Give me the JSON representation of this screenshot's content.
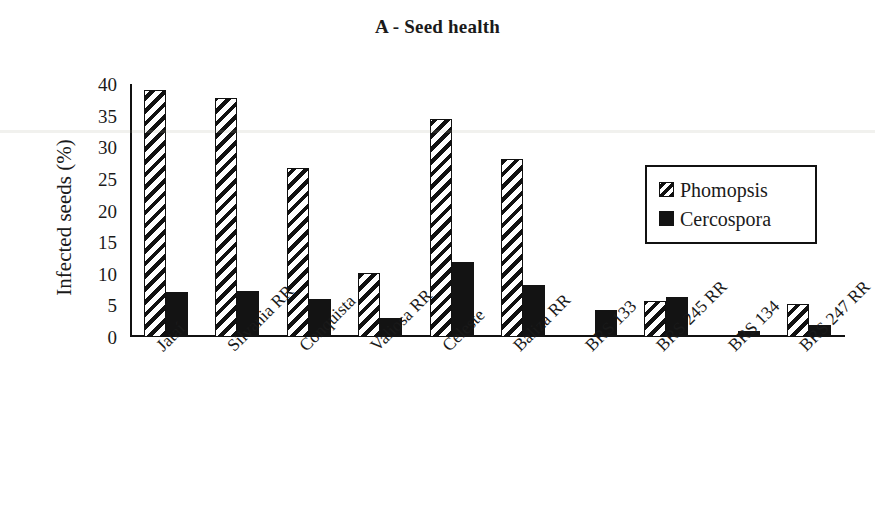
{
  "chart_data": {
    "type": "bar",
    "title": "A - Seed health",
    "xlabel": "",
    "ylabel": "Infected seeds (%)",
    "ylim": [
      0,
      40
    ],
    "yticks": [
      0,
      5,
      10,
      15,
      20,
      25,
      30,
      35,
      40
    ],
    "ytick_labels": [
      "0",
      "5",
      "10",
      "15",
      "20",
      "25",
      "30",
      "35",
      "40"
    ],
    "grid": false,
    "legend_position": "upper right inside",
    "categories": [
      "Jataí",
      "Silvania RR",
      "Conquista",
      "Valiosa RR",
      "Celeste",
      "Baliza RR",
      "BRS 133",
      "BRS 245 RR",
      "BRS 134",
      "BRS 247 RR"
    ],
    "series": [
      {
        "name": "Phomopsis",
        "fill": "diagonal-hatch",
        "color": "#111111",
        "values": [
          39.0,
          37.8,
          26.8,
          10.2,
          34.5,
          28.2,
          0.0,
          5.7,
          0.0,
          5.2
        ]
      },
      {
        "name": "Cercospora",
        "fill": "solid",
        "color": "#131313",
        "values": [
          7.1,
          7.3,
          6.0,
          3.0,
          11.8,
          8.2,
          4.3,
          6.3,
          1.0,
          1.9
        ]
      }
    ]
  },
  "legend": {
    "entries": [
      {
        "label": "Phomopsis"
      },
      {
        "label": "Cercospora"
      }
    ]
  },
  "axis": {
    "y_title": "Infected seeds (%)"
  },
  "colors": {
    "ink": "#111111",
    "background": "#ffffff"
  }
}
